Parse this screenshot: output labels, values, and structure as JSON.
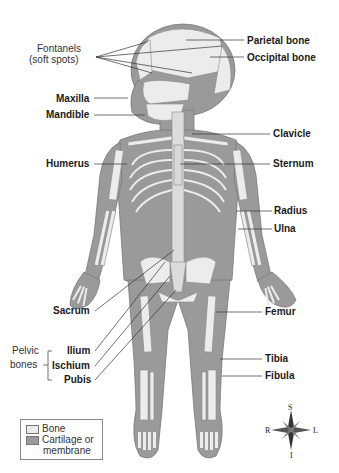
{
  "figure": {
    "colors": {
      "bone": "#ececec",
      "cartilage": "#9a9a9a",
      "outline": "#7a7a7a",
      "leader": "#333333"
    }
  },
  "labels": {
    "fontanels": [
      "Fontanels",
      "(soft spots)"
    ],
    "parietal": "Parietal bone",
    "occipital": "Occipital bone",
    "maxilla": "Maxilla",
    "mandible": "Mandible",
    "clavicle": "Clavicle",
    "humerus": "Humerus",
    "sternum": "Sternum",
    "radius": "Radius",
    "ulna": "Ulna",
    "sacrum": "Sacrum",
    "femur": "Femur",
    "pelvic_group": [
      "Pelvic",
      "bones"
    ],
    "ilium": "Ilium",
    "ischium": "Ischium",
    "pubis": "Pubis",
    "tibia": "Tibia",
    "fibula": "Fibula"
  },
  "legend": {
    "items": [
      {
        "label": "Bone",
        "color": "#ececec"
      },
      {
        "label": "Cartilage or",
        "label2": "membrane",
        "color": "#9a9a9a"
      }
    ]
  },
  "compass": {
    "top": "S",
    "bottom": "I",
    "left": "R",
    "right": "L"
  }
}
